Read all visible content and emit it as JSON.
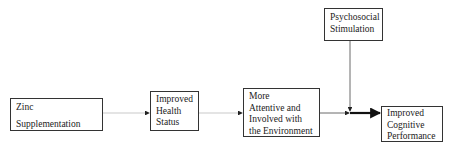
{
  "diagram": {
    "type": "flowchart",
    "nodes": [
      {
        "id": "zinc",
        "lines": [
          "Zinc",
          "Supplementation"
        ]
      },
      {
        "id": "health",
        "lines": [
          "Improved",
          "Health",
          "Status"
        ]
      },
      {
        "id": "attentive",
        "lines": [
          "More",
          "Attentive and",
          "Involved with",
          "the Environment"
        ]
      },
      {
        "id": "psychosocial",
        "lines": [
          "Psychosocial",
          "Stimulation"
        ]
      },
      {
        "id": "cognitive",
        "lines": [
          "Improved",
          "Cognitive",
          "Performance"
        ]
      }
    ],
    "edges": [
      {
        "from": "zinc",
        "to": "health",
        "style": "thin-light"
      },
      {
        "from": "health",
        "to": "attentive",
        "style": "thin-light"
      },
      {
        "from": "attentive",
        "to": "cognitive",
        "style": "thin"
      },
      {
        "from": "psychosocial",
        "to": "attentive-cognitive-edge",
        "style": "thin"
      },
      {
        "from": "junction",
        "to": "cognitive",
        "style": "thick"
      }
    ]
  }
}
